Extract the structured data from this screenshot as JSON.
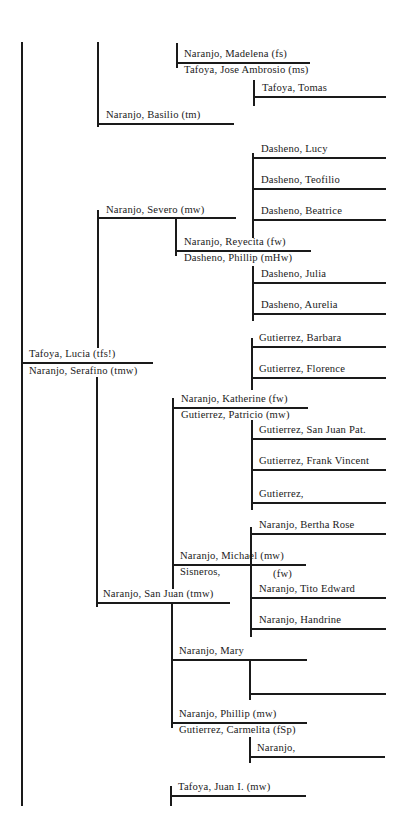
{
  "title": "",
  "colors": {
    "ink": "#1a1a1a",
    "paper": "#ffffff"
  },
  "people": [
    {
      "id": "madelena",
      "label": "Naranjo, Madelena (fs)",
      "x": 184,
      "y": 48
    },
    {
      "id": "jose_ambrosio",
      "label": "Tafoya, Jose Ambrosio (ms)",
      "x": 184,
      "y": 64
    },
    {
      "id": "tomas",
      "label": "Tafoya, Tomas",
      "x": 262,
      "y": 82
    },
    {
      "id": "basilio",
      "label": "Naranjo, Basilio (tm)",
      "x": 106,
      "y": 109
    },
    {
      "id": "lucy",
      "label": "Dasheno, Lucy",
      "x": 261,
      "y": 143
    },
    {
      "id": "teofilio",
      "label": "Dasheno, Teofilio",
      "x": 261,
      "y": 174
    },
    {
      "id": "beatrice",
      "label": "Dasheno, Beatrice",
      "x": 261,
      "y": 205
    },
    {
      "id": "severo",
      "label": "Naranjo, Severo (mw)",
      "x": 106,
      "y": 204
    },
    {
      "id": "reyecita",
      "label": "Naranjo, Reyecita (fw)",
      "x": 184,
      "y": 236
    },
    {
      "id": "phillip_d",
      "label": "Dasheno, Phillip (mHw)",
      "x": 184,
      "y": 252
    },
    {
      "id": "julia",
      "label": "Dasheno, Julia",
      "x": 261,
      "y": 268
    },
    {
      "id": "aurelia",
      "label": "Dasheno, Aurelia",
      "x": 261,
      "y": 299
    },
    {
      "id": "barbara",
      "label": "Gutierrez, Barbara",
      "x": 259,
      "y": 332
    },
    {
      "id": "lucia",
      "label": "Tafoya, Lucia (tfs!)",
      "x": 29,
      "y": 348
    },
    {
      "id": "serafino",
      "label": "Naranjo, Serafino (tmw)",
      "x": 29,
      "y": 365
    },
    {
      "id": "florence",
      "label": "Gutierrez, Florence",
      "x": 259,
      "y": 363
    },
    {
      "id": "katherine",
      "label": "Naranjo, Katherine (fw)",
      "x": 181,
      "y": 393
    },
    {
      "id": "patricio",
      "label": "Gutierrez, Patricio (mw)",
      "x": 181,
      "y": 409
    },
    {
      "id": "sanjuan_pat",
      "label": "Gutierrez, San Juan Pat.",
      "x": 259,
      "y": 424
    },
    {
      "id": "frank_vincent",
      "label": "Gutierrez, Frank Vincent",
      "x": 259,
      "y": 455
    },
    {
      "id": "gutierrez_blank",
      "label": "Gutierrez,",
      "x": 259,
      "y": 488
    },
    {
      "id": "bertha",
      "label": "Naranjo, Bertha Rose",
      "x": 259,
      "y": 519
    },
    {
      "id": "michael",
      "label": "Naranjo, Michael (mw)",
      "x": 180,
      "y": 550
    },
    {
      "id": "sisneros",
      "label": "Sisneros,",
      "x": 180,
      "y": 566
    },
    {
      "id": "sisneros_fw",
      "label": "(fw)",
      "x": 273,
      "y": 568
    },
    {
      "id": "tito",
      "label": "Naranjo, Tito Edward",
      "x": 259,
      "y": 583
    },
    {
      "id": "sanjuan",
      "label": "Naranjo, San Juan (tmw)",
      "x": 103,
      "y": 588
    },
    {
      "id": "handrine",
      "label": "Naranjo, Handrine",
      "x": 259,
      "y": 614
    },
    {
      "id": "mary",
      "label": "Naranjo, Mary",
      "x": 179,
      "y": 645
    },
    {
      "id": "phillip_n",
      "label": "Naranjo, Phillip (mw)",
      "x": 179,
      "y": 708
    },
    {
      "id": "carmelita",
      "label": "Gutierrez, Carmelita (fSp)",
      "x": 179,
      "y": 724
    },
    {
      "id": "naranjo_blank",
      "label": "Naranjo,",
      "x": 257,
      "y": 742
    },
    {
      "id": "juan_i",
      "label": "Tafoya, Juan I. (mw)",
      "x": 178,
      "y": 781
    }
  ],
  "lines": [
    {
      "o": "v",
      "x": 21,
      "y1": 42,
      "y2": 806
    },
    {
      "o": "v",
      "x": 97,
      "y1": 42,
      "y2": 127
    },
    {
      "o": "h",
      "y": 123,
      "x1": 97,
      "x2": 234
    },
    {
      "o": "v",
      "x": 176,
      "y1": 43,
      "y2": 68
    },
    {
      "o": "h",
      "y": 62,
      "x1": 176,
      "x2": 310
    },
    {
      "o": "v",
      "x": 253,
      "y1": 80,
      "y2": 106
    },
    {
      "o": "h",
      "y": 96,
      "x1": 253,
      "x2": 386
    },
    {
      "o": "v",
      "x": 97,
      "y1": 210,
      "y2": 348
    },
    {
      "o": "h",
      "y": 217,
      "x1": 97,
      "x2": 236
    },
    {
      "o": "v",
      "x": 175,
      "y1": 218,
      "y2": 256
    },
    {
      "o": "h",
      "y": 250,
      "x1": 175,
      "x2": 311
    },
    {
      "o": "v",
      "x": 252,
      "y1": 153,
      "y2": 238
    },
    {
      "o": "h",
      "y": 157,
      "x1": 252,
      "x2": 386
    },
    {
      "o": "h",
      "y": 188,
      "x1": 252,
      "x2": 386
    },
    {
      "o": "h",
      "y": 219,
      "x1": 252,
      "x2": 386
    },
    {
      "o": "v",
      "x": 252,
      "y1": 266,
      "y2": 321
    },
    {
      "o": "h",
      "y": 282,
      "x1": 252,
      "x2": 386
    },
    {
      "o": "h",
      "y": 313,
      "x1": 252,
      "x2": 386
    },
    {
      "o": "h",
      "y": 362,
      "x1": 21,
      "x2": 153
    },
    {
      "o": "v",
      "x": 96,
      "y1": 377,
      "y2": 607
    },
    {
      "o": "h",
      "y": 602,
      "x1": 96,
      "x2": 230
    },
    {
      "o": "v",
      "x": 251,
      "y1": 338,
      "y2": 390
    },
    {
      "o": "h",
      "y": 346,
      "x1": 251,
      "x2": 386
    },
    {
      "o": "h",
      "y": 377,
      "x1": 251,
      "x2": 386
    },
    {
      "o": "v",
      "x": 172,
      "y1": 398,
      "y2": 589
    },
    {
      "o": "h",
      "y": 407,
      "x1": 172,
      "x2": 308
    },
    {
      "o": "v",
      "x": 251,
      "y1": 420,
      "y2": 510
    },
    {
      "o": "h",
      "y": 438,
      "x1": 251,
      "x2": 386
    },
    {
      "o": "h",
      "y": 469,
      "x1": 251,
      "x2": 386
    },
    {
      "o": "h",
      "y": 502,
      "x1": 251,
      "x2": 386
    },
    {
      "o": "h",
      "y": 564,
      "x1": 172,
      "x2": 306
    },
    {
      "o": "v",
      "x": 250,
      "y1": 527,
      "y2": 637
    },
    {
      "o": "h",
      "y": 533,
      "x1": 250,
      "x2": 386
    },
    {
      "o": "h",
      "y": 597,
      "x1": 250,
      "x2": 386
    },
    {
      "o": "h",
      "y": 628,
      "x1": 250,
      "x2": 386
    },
    {
      "o": "v",
      "x": 171,
      "y1": 604,
      "y2": 728
    },
    {
      "o": "h",
      "y": 659,
      "x1": 171,
      "x2": 307
    },
    {
      "o": "v",
      "x": 249,
      "y1": 660,
      "y2": 700
    },
    {
      "o": "h",
      "y": 693,
      "x1": 249,
      "x2": 386
    },
    {
      "o": "h",
      "y": 722,
      "x1": 171,
      "x2": 307
    },
    {
      "o": "v",
      "x": 249,
      "y1": 737,
      "y2": 763
    },
    {
      "o": "h",
      "y": 756,
      "x1": 249,
      "x2": 385
    },
    {
      "o": "v",
      "x": 170,
      "y1": 786,
      "y2": 806
    },
    {
      "o": "h",
      "y": 795,
      "x1": 170,
      "x2": 306
    }
  ]
}
